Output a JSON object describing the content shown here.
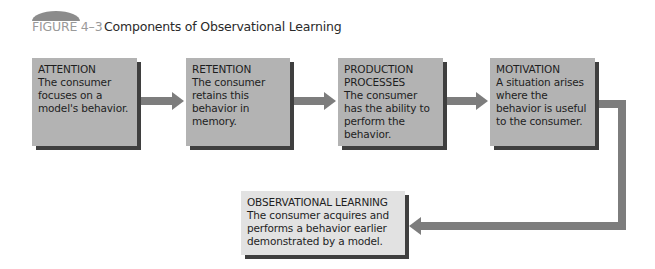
{
  "figure": {
    "label": "FIGURE 4–3",
    "title": "Components of Observational Learning"
  },
  "colors": {
    "box_fill": "#b3b3b3",
    "final_box_fill": "#e2e2e2",
    "shadow": "#3f3f3f",
    "arrow": "#7d7d7d",
    "label_gray": "#9a9a9a"
  },
  "steps": [
    {
      "heading": "ATTENTION",
      "text": "The consumer focuses on a model's behavior."
    },
    {
      "heading": "RETENTION",
      "text": "The consumer retains this behavior in memory."
    },
    {
      "heading": "PRODUCTION PROCESSES",
      "text": "The consumer has the ability to perform the behavior."
    },
    {
      "heading": "MOTIVATION",
      "text": "A situation arises where the behavior is useful to the consumer."
    }
  ],
  "outcome": {
    "heading": "OBSERVATIONAL LEARNING",
    "text": "The consumer acquires and performs a behavior earlier demonstrated by a model."
  }
}
